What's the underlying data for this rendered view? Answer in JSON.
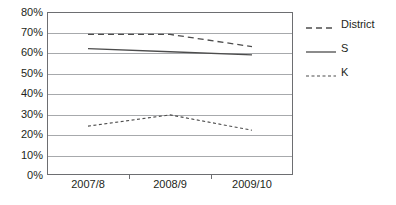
{
  "chart_data": {
    "type": "line",
    "title": "",
    "subtitle": "",
    "xlabel": "",
    "ylabel": "",
    "categories": [
      "2007/8",
      "2008/9",
      "2009/10"
    ],
    "ylim": [
      0,
      80
    ],
    "ytick_values": [
      0,
      10,
      20,
      30,
      40,
      50,
      60,
      70,
      80
    ],
    "ytick_labels": [
      "0%",
      "10%",
      "20%",
      "30%",
      "40%",
      "50%",
      "60%",
      "70%",
      "80%"
    ],
    "grid": true,
    "legend_position": "right",
    "series": [
      {
        "name": "District",
        "style": "long-dashed",
        "color": "#4d4d4d",
        "values": [
          69,
          69,
          63
        ]
      },
      {
        "name": "S",
        "style": "solid",
        "color": "#4d4d4d",
        "values": [
          62,
          60.5,
          59
        ]
      },
      {
        "name": "K",
        "style": "short-dashed",
        "color": "#4d4d4d",
        "values": [
          24,
          29.5,
          22
        ]
      }
    ]
  },
  "axes": {
    "y_labels": [
      "80%",
      "70%",
      "60%",
      "50%",
      "40%",
      "30%",
      "20%",
      "10%",
      "0%"
    ],
    "x_labels": [
      "2007/8",
      "2008/9",
      "2009/10"
    ]
  },
  "legend": {
    "items": [
      {
        "label": "District",
        "swatch": "long-dashed-line-icon"
      },
      {
        "label": "S",
        "swatch": "solid-line-icon"
      },
      {
        "label": "K",
        "swatch": "short-dashed-line-icon"
      }
    ]
  },
  "colors": {
    "grid": "#a7a9ac",
    "axis": "#6d6e71",
    "series": "#4d4d4d",
    "text": "#231f20",
    "background": "#ffffff"
  }
}
